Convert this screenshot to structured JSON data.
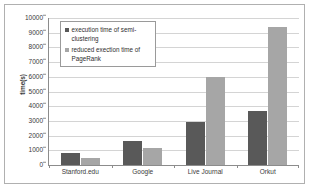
{
  "chart_data": {
    "type": "bar",
    "title": "",
    "xlabel": "",
    "ylabel": "time(s)",
    "ylim": [
      0,
      10000
    ],
    "ytick_step": 1000,
    "grid": true,
    "legend_position": "upper-left-inside",
    "categories": [
      "Stanford.edu",
      "Google",
      "Live Journal",
      "Orkut"
    ],
    "ytick_labels": [
      "10000",
      "9000",
      "8000",
      "7000",
      "6000",
      "5000",
      "4000",
      "3000",
      "2000",
      "1000",
      "0"
    ],
    "series": [
      {
        "name": "execution time of semi-clustering",
        "color": "#595959",
        "values": [
          800,
          1600,
          2900,
          3700
        ]
      },
      {
        "name": "reduced exection time of PageRank",
        "color": "#a6a6a6",
        "values": [
          450,
          1150,
          6000,
          9400
        ]
      }
    ]
  },
  "legend": {
    "entries": [
      {
        "label": "execution time of semi-clustering"
      },
      {
        "label": "reduced exection time of PageRank"
      }
    ]
  },
  "colors": {
    "series_0": "#595959",
    "series_1": "#a6a6a6",
    "gridline": "#d4d4d4",
    "axis": "#8c8c8c",
    "border": "#b0b0b0"
  }
}
